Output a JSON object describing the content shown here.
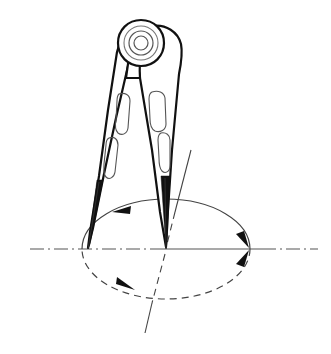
{
  "figure": {
    "background_color": "#ffffff",
    "line_color": "#111111",
    "thin_line_color": "#555555",
    "construction_line_color": "#444444"
  },
  "parts": [
    {
      "id": "hinge",
      "name": "hinge-pivot-head",
      "label": "Hinge head"
    },
    {
      "id": "left-leg",
      "name": "left-leg",
      "label": "Left leg"
    },
    {
      "id": "right-leg",
      "name": "right-leg",
      "label": "Right leg"
    },
    {
      "id": "left-point",
      "name": "left-leg-point",
      "label": "Scribing point"
    },
    {
      "id": "right-point",
      "name": "right-leg-point",
      "label": "Pivot needle point"
    }
  ],
  "geometry": {
    "ellipse": {
      "center_x": 166,
      "center_y": 249,
      "radius_x": 84,
      "radius_y": 50,
      "upper_half_style": "solid",
      "lower_half_style": "dashed"
    },
    "horizontal_centerline": {
      "y": 249,
      "x_start": 30,
      "x_end": 318,
      "style": "dash-dot"
    },
    "tilted_axis": {
      "top_x": 191,
      "top_y": 150,
      "bottom_x": 145,
      "bottom_y": 333,
      "style": "solid-with-hidden-dashes"
    },
    "hinge_center": {
      "x": 141,
      "y": 43
    },
    "hinge_radii": [
      7,
      12,
      17
    ],
    "left_point": {
      "x": 88,
      "y": 248
    },
    "right_point": {
      "x": 166,
      "y": 249
    }
  },
  "annotations": {
    "arrows": [
      {
        "name": "upper-arc-direction-arrow",
        "position": "upper-left arc",
        "direction": "counter-clockwise, pointing left"
      },
      {
        "name": "lower-arc-direction-arrow",
        "position": "lower-left arc",
        "direction": "pointing right along dashed arc"
      },
      {
        "name": "right-vertex-upper-arrow",
        "position": "right vertex of ellipse",
        "direction": "pointing down to axis"
      },
      {
        "name": "right-vertex-lower-arrow",
        "position": "right vertex of ellipse",
        "direction": "pointing up to axis"
      }
    ]
  }
}
